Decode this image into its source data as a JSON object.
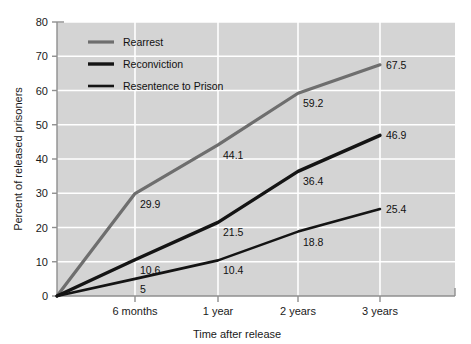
{
  "chart_data": {
    "type": "line",
    "title": "",
    "xlabel": "Time after release",
    "ylabel": "Percent of released prisoners",
    "categories": [
      "6 months",
      "1 year",
      "2 years",
      "3 years"
    ],
    "x_tick_labels": [
      "6 months",
      "1 year",
      "2 years",
      "3 years"
    ],
    "y_tick_labels": [
      "0",
      "10",
      "20",
      "30",
      "40",
      "50",
      "60",
      "70",
      "80"
    ],
    "ylim": [
      0,
      80
    ],
    "grid": true,
    "legend_position": "top-left inside plot",
    "origin_value": 0,
    "series": [
      {
        "name": "Rearrest",
        "color": "#6e6e6e",
        "width": 3.2,
        "values": [
          29.9,
          44.1,
          59.2,
          67.5
        ],
        "labels": [
          "29.9",
          "44.1",
          "59.2",
          "67.5"
        ]
      },
      {
        "name": "Reconviction",
        "color": "#141414",
        "width": 3.4,
        "values": [
          10.6,
          21.5,
          36.4,
          46.9
        ],
        "labels": [
          "10.6",
          "21.5",
          "36.4",
          "46.9"
        ]
      },
      {
        "name": "Resentence to Prison",
        "color": "#141414",
        "width": 2.6,
        "values": [
          5,
          10.4,
          18.8,
          25.4
        ],
        "labels": [
          "5",
          "10.4",
          "18.8",
          "25.4"
        ]
      }
    ]
  },
  "legend": {
    "items": [
      {
        "label": "Rearrest",
        "swatch_color": "#6e6e6e"
      },
      {
        "label": "Reconviction",
        "swatch_color": "#141414"
      },
      {
        "label": "Resentence to Prison",
        "swatch_color": "#141414"
      }
    ]
  },
  "axes": {
    "y_title": "Percent of released prisoners",
    "x_title": "Time after release",
    "y_ticks": [
      "80",
      "70",
      "60",
      "50",
      "40",
      "30",
      "20",
      "10",
      "0"
    ],
    "x_ticks": [
      "6 months",
      "1 year",
      "2 years",
      "3 years"
    ]
  },
  "colors": {
    "plot_background": "#d4d4d4",
    "gridline": "#ffffff",
    "axis_line": "#8f8f8f",
    "text": "#1a1a1a",
    "series_gray": "#6e6e6e",
    "series_black": "#141414"
  }
}
